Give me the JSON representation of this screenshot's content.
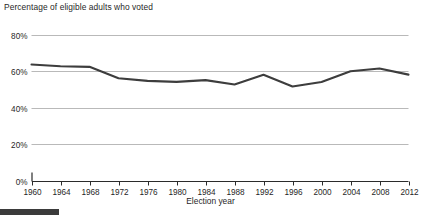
{
  "chart_data": {
    "type": "line",
    "title": "Percentage of eligible adults who voted",
    "xlabel": "Election year",
    "ylabel": "",
    "x": [
      1960,
      1964,
      1968,
      1972,
      1976,
      1980,
      1984,
      1988,
      1992,
      1996,
      2000,
      2004,
      2008,
      2012
    ],
    "values": [
      63.8,
      62.8,
      62.5,
      56.2,
      54.8,
      54.2,
      55.2,
      52.8,
      58.1,
      51.7,
      54.2,
      60.1,
      61.6,
      58.2
    ],
    "categories": [
      "1960",
      "1964",
      "1968",
      "1972",
      "1976",
      "1980",
      "1984",
      "1988",
      "1992",
      "1996",
      "2000",
      "2004",
      "2008",
      "2012"
    ],
    "xlim": [
      1960,
      2012
    ],
    "ylim": [
      0,
      80
    ],
    "y_ticks": [
      0,
      20,
      40,
      60,
      80
    ],
    "y_tick_labels": [
      "0%",
      "20%",
      "40%",
      "60%",
      "80%"
    ],
    "x_ticks": [
      1960,
      1964,
      1968,
      1972,
      1976,
      1980,
      1984,
      1988,
      1992,
      1996,
      2000,
      2004,
      2008,
      2012
    ],
    "grid": true,
    "grid_axis": "y",
    "legend": false,
    "series": [
      {
        "name": "Percentage of eligible adults who voted",
        "values": [
          63.8,
          62.8,
          62.5,
          56.2,
          54.8,
          54.2,
          55.2,
          52.8,
          58.1,
          51.7,
          54.2,
          60.1,
          61.6,
          58.2
        ]
      }
    ],
    "colors": {
      "line": "#3d3d3d",
      "grid": "#b9b9b9",
      "axis": "#2b2b2b",
      "text": "#1f1f1f",
      "background": "#ffffff"
    }
  },
  "decoration": {
    "bottom_bar_color": "#3b3b3b"
  }
}
